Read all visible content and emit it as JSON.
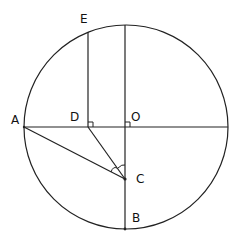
{
  "diagram": {
    "type": "geometry",
    "circle": {
      "cx": 126,
      "cy": 127,
      "r": 102
    },
    "points": {
      "A": {
        "label": "A",
        "x": 24,
        "y": 127,
        "lx": 12,
        "ly": 123
      },
      "B": {
        "label": "B",
        "x": 125,
        "y": 229,
        "lx": 132,
        "ly": 222
      },
      "C": {
        "label": "C",
        "x": 125,
        "y": 179,
        "lx": 136,
        "ly": 182
      },
      "D": {
        "label": "D",
        "x": 88,
        "y": 127,
        "lx": 70,
        "ly": 120
      },
      "E": {
        "label": "E",
        "x": 88,
        "y": 32,
        "lx": 80,
        "ly": 22
      },
      "O": {
        "label": "O",
        "x": 125,
        "y": 127,
        "lx": 131,
        "ly": 120
      }
    },
    "segments": [
      {
        "from": "A",
        "to": "C"
      },
      {
        "from": "D",
        "to": "C"
      },
      {
        "from": "D",
        "to": "E"
      },
      {
        "from": "A",
        "to": "right_edge"
      },
      {
        "from": "top",
        "to": "B"
      }
    ],
    "right_angle_marks": [
      "D",
      "O"
    ],
    "angle_marks": [
      "ACD",
      "DCO"
    ],
    "colors": {
      "stroke": "#222222",
      "background": "#ffffff"
    }
  }
}
